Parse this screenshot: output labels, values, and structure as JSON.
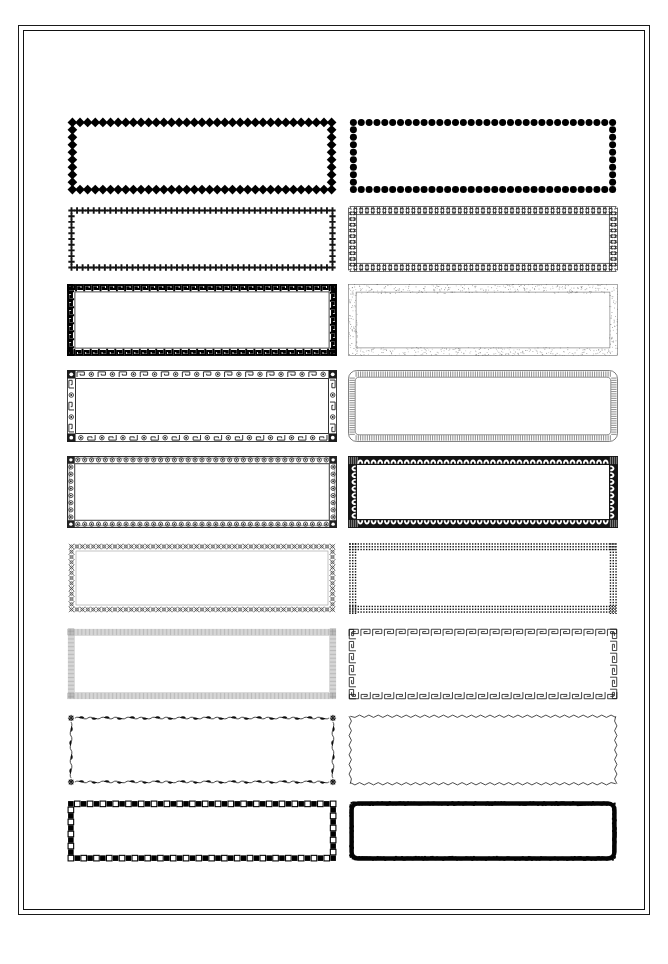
{
  "page": {
    "background_color": "#ffffff",
    "ink_color": "#111111",
    "width_px": 668,
    "height_px": 964,
    "border_style": "double-rule",
    "outer_rule_color": "#1a1a1a",
    "inner_rule_color": "#111111"
  },
  "grid": {
    "rows": 9,
    "columns": 2,
    "total_frames": 18,
    "column_labels": [
      "left",
      "right"
    ]
  },
  "frames": [
    {
      "index": 1,
      "row": 1,
      "column": "left",
      "name": "bold-diamond-bead-frame",
      "motif": "diamond",
      "description": "Heavy solid black diamond beads set edge to edge",
      "weight": "heavy",
      "color": "#000000",
      "fill": "solid",
      "x": 44,
      "y": 87,
      "w": 270,
      "h": 78
    },
    {
      "index": 2,
      "row": 1,
      "column": "right",
      "name": "bold-dot-bead-frame",
      "motif": "circle",
      "description": "Heavy solid black round beads evenly spaced",
      "weight": "heavy",
      "color": "#000000",
      "fill": "solid",
      "x": 325,
      "y": 87,
      "w": 270,
      "h": 78
    },
    {
      "index": 3,
      "row": 2,
      "column": "left",
      "name": "small-cross-frame",
      "motif": "cross",
      "description": "Row of small plus / cross glyphs",
      "weight": "light",
      "color": "#151515",
      "fill": "solid",
      "x": 44,
      "y": 176,
      "w": 270,
      "h": 66
    },
    {
      "index": 4,
      "row": 2,
      "column": "right",
      "name": "cross-pattee-frame",
      "motif": "cross-pattee",
      "description": "Maltese style flared crosses in outline",
      "weight": "light",
      "color": "#1a1a1a",
      "fill": "outline",
      "x": 325,
      "y": 176,
      "w": 270,
      "h": 66
    },
    {
      "index": 5,
      "row": 3,
      "column": "left",
      "name": "greek-key-solid-frame",
      "motif": "greek-key",
      "description": "Dense solid black greek key meander band",
      "weight": "heavy",
      "color": "#000000",
      "fill": "solid",
      "x": 44,
      "y": 254,
      "w": 270,
      "h": 72
    },
    {
      "index": 6,
      "row": 3,
      "column": "right",
      "name": "stipple-texture-frame",
      "motif": "stipple",
      "description": "Fine grey speckled stipple band with thin keyline",
      "weight": "light",
      "color": "#6b6b6b",
      "fill": "texture",
      "x": 325,
      "y": 254,
      "w": 270,
      "h": 72
    },
    {
      "index": 7,
      "row": 4,
      "column": "left",
      "name": "greek-key-roundel-frame",
      "motif": "greek-key-with-roundels",
      "description": "Meander band alternating with small dotted roundels and solid corner blocks",
      "weight": "medium",
      "color": "#1c1c1c",
      "fill": "mixed",
      "x": 44,
      "y": 340,
      "w": 270,
      "h": 72
    },
    {
      "index": 8,
      "row": 4,
      "column": "right",
      "name": "rounded-comb-hatch-frame",
      "motif": "comb-hatch",
      "description": "Rounded corner frame with fine perpendicular comb ticks",
      "weight": "light",
      "color": "#4a4a4a",
      "fill": "hatch",
      "x": 325,
      "y": 340,
      "w": 270,
      "h": 72
    },
    {
      "index": 9,
      "row": 5,
      "column": "left",
      "name": "eyelet-dot-frame",
      "motif": "eyelet",
      "description": "Row of small ringed eyelets between two rules, solid corner squares",
      "weight": "medium",
      "color": "#222222",
      "fill": "outline",
      "x": 44,
      "y": 426,
      "w": 270,
      "h": 72
    },
    {
      "index": 10,
      "row": 5,
      "column": "right",
      "name": "scroll-wave-frame",
      "motif": "scroll-wave",
      "description": "Repeating scroll / wave curls on dark ground with corner blocks",
      "weight": "heavy",
      "color": "#141414",
      "fill": "reverse",
      "x": 325,
      "y": 426,
      "w": 270,
      "h": 72
    },
    {
      "index": 11,
      "row": 6,
      "column": "left",
      "name": "lattice-diaper-frame",
      "motif": "lattice",
      "description": "Open lattice of small crossed diamonds and circlets",
      "weight": "light",
      "color": "#3a3a3a",
      "fill": "outline",
      "x": 44,
      "y": 512,
      "w": 270,
      "h": 72
    },
    {
      "index": 12,
      "row": 6,
      "column": "right",
      "name": "square-dot-grid-frame",
      "motif": "square-dot",
      "description": "Triple row of tiny solid squares forming a dotted band",
      "weight": "medium",
      "color": "#101010",
      "fill": "solid",
      "x": 325,
      "y": 512,
      "w": 270,
      "h": 72
    },
    {
      "index": 13,
      "row": 7,
      "column": "left",
      "name": "fine-rule-hatch-frame",
      "motif": "vertical-hatch",
      "description": "Very fine close vertical rule hatching in pale grey",
      "weight": "light",
      "color": "#8a8a8a",
      "fill": "hatch",
      "x": 44,
      "y": 598,
      "w": 270,
      "h": 72
    },
    {
      "index": 14,
      "row": 7,
      "column": "right",
      "name": "greek-key-outline-frame",
      "motif": "greek-key",
      "description": "Large open outline greek key meander",
      "weight": "medium",
      "color": "#151515",
      "fill": "outline",
      "x": 325,
      "y": 598,
      "w": 270,
      "h": 72
    },
    {
      "index": 15,
      "row": 8,
      "column": "left",
      "name": "vine-leaf-frame",
      "motif": "vine-leaf",
      "description": "Undulating vine ribbon with solid leaves and corner rosettes",
      "weight": "medium",
      "color": "#0d0d0d",
      "fill": "solid",
      "x": 44,
      "y": 684,
      "w": 270,
      "h": 72
    },
    {
      "index": 16,
      "row": 8,
      "column": "right",
      "name": "zigzag-line-frame",
      "motif": "zigzag",
      "description": "Single fine sawtooth zigzag line rectangle",
      "weight": "light",
      "color": "#151515",
      "fill": "line",
      "x": 325,
      "y": 684,
      "w": 270,
      "h": 72
    },
    {
      "index": 17,
      "row": 9,
      "column": "left",
      "name": "checker-square-frame",
      "motif": "checker",
      "description": "Alternating solid and open squares forming a checkerboard band",
      "weight": "heavy",
      "color": "#000000",
      "fill": "alternating",
      "x": 44,
      "y": 770,
      "w": 270,
      "h": 62
    },
    {
      "index": 18,
      "row": 9,
      "column": "right",
      "name": "rough-brush-frame",
      "motif": "rough-brush",
      "description": "Thick rough hand drawn brush stroke rectangle with rounded corners",
      "weight": "heavy",
      "color": "#050505",
      "fill": "solid",
      "x": 325,
      "y": 770,
      "w": 270,
      "h": 62
    }
  ]
}
